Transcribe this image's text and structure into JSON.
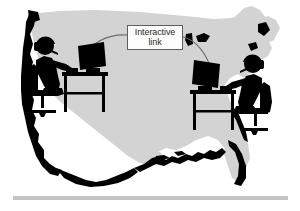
{
  "illustration": {
    "title": "Interactive link between two computer users across the United States",
    "map_region": "United States",
    "link_label": {
      "line1": "Interactive",
      "line2": "link"
    },
    "figures": [
      {
        "id": "west-user",
        "label": "Person with headset at computer desk, west coast",
        "facing": "right"
      },
      {
        "id": "east-user",
        "label": "Person with headset at computer desk, east coast",
        "facing": "left"
      }
    ],
    "colors": {
      "map_fill": "#d3d3d3",
      "map_shadow": "#000000",
      "figure_fill": "#000000",
      "label_border": "#5d5d5d",
      "label_text": "#2b2b2b",
      "label_background": "#fdfdfd",
      "link_line": "#6b6b6b",
      "bottom_rule": "#c4c4c4",
      "page_background": "#ffffff"
    }
  }
}
